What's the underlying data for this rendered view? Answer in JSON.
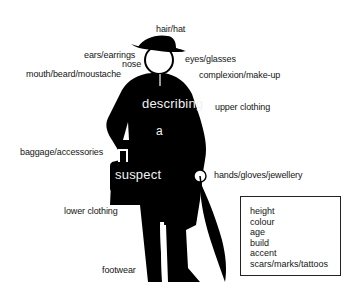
{
  "figure": {
    "title_words": [
      "describing",
      "a",
      "suspect"
    ],
    "labels": {
      "hair_hat": "hair/hat",
      "ears_earrings": "ears/earrings",
      "nose": "nose",
      "mouth_beard_moustache": "mouth/beard/moustache",
      "eyes_glasses": "eyes/glasses",
      "complexion_makeup": "complexion/make-up",
      "upper_clothing": "upper clothing",
      "baggage_accessories": "baggage/accessories",
      "hands_gloves_jewellery": "hands/gloves/jewellery",
      "lower_clothing": "lower clothing",
      "footwear": "footwear"
    },
    "attributes_box": [
      "height",
      "colour",
      "age",
      "build",
      "accent",
      "scars/marks/tattoos"
    ],
    "colors": {
      "silhouette": "#000000",
      "background": "#ffffff",
      "inverse_text": "#f2f2f2"
    }
  }
}
